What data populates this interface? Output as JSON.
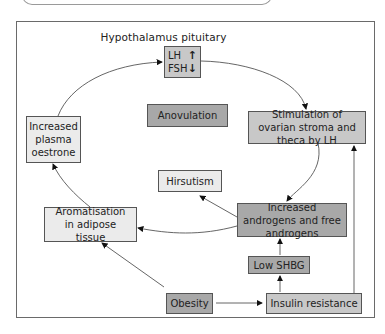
{
  "diagram": {
    "title": "Hypothalamus pituitary",
    "hormones": {
      "lh": {
        "label": "LH",
        "direction": "up",
        "glyph": "↑"
      },
      "fsh": {
        "label": "FSH",
        "direction": "down",
        "glyph": "↓"
      }
    },
    "nodes": {
      "oestrone": "Increased plasma oestrone",
      "anovulation": "Anovulation",
      "stimulation": "Stimulation of ovarian stroma and theca by LH",
      "hirsutism": "Hirsutism",
      "androgens": "Increased androgens and free androgens",
      "aromatisation": "Aromatisation in adipose tissue",
      "low_shbg": "Low SHBG",
      "obesity": "Obesity",
      "insulin": "Insulin resistance"
    },
    "edges": [
      [
        "hypothalamus_pituitary",
        "stimulation"
      ],
      [
        "stimulation",
        "androgens"
      ],
      [
        "androgens",
        "hirsutism"
      ],
      [
        "androgens",
        "aromatisation"
      ],
      [
        "aromatisation",
        "oestrone"
      ],
      [
        "oestrone",
        "hypothalamus_pituitary"
      ],
      [
        "obesity",
        "aromatisation"
      ],
      [
        "obesity",
        "insulin"
      ],
      [
        "insulin",
        "low_shbg"
      ],
      [
        "low_shbg",
        "androgens"
      ],
      [
        "insulin",
        "stimulation"
      ]
    ],
    "colors": {
      "light_box": "#ebebeb",
      "dark_box": "#a8a8a8",
      "mid_box": "#c8c8c8",
      "line": "#444444"
    }
  }
}
